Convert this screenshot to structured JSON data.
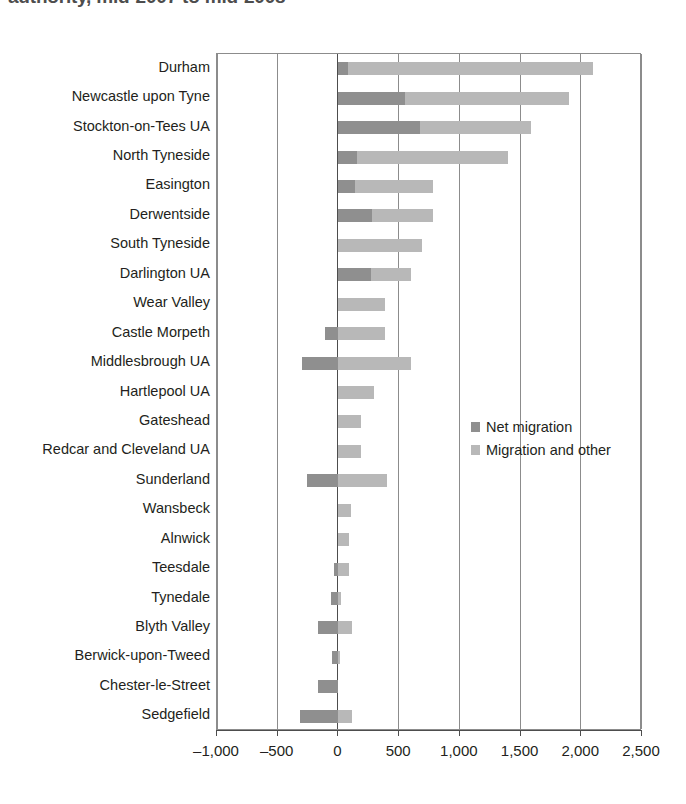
{
  "title": "authority, mid-2007 to mid-2008",
  "legend": {
    "items": [
      {
        "label": "Net migration",
        "color": "#8f8f8f",
        "name": "net-migration"
      },
      {
        "label": "Migration and other",
        "color": "#b8b8b8",
        "name": "migration-and-other"
      }
    ]
  },
  "axis": {
    "tick_labels": [
      "–1,000",
      "–500",
      "0",
      "500",
      "1,000",
      "1,500",
      "2,000",
      "2,500"
    ],
    "tick_values": [
      -1000,
      -500,
      0,
      500,
      1000,
      1500,
      2000,
      2500
    ]
  },
  "chart_data": {
    "type": "bar",
    "orientation": "horizontal",
    "title": "authority, mid-2007 to mid-2008",
    "xlabel": "",
    "ylabel": "",
    "xlim": [
      -1000,
      2500
    ],
    "grid": true,
    "legend_position": "inside-right",
    "categories": [
      "Durham",
      "Newcastle upon Tyne",
      "Stockton-on-Tees UA",
      "North Tyneside",
      "Easington",
      "Derwentside",
      "South Tyneside",
      "Darlington UA",
      "Wear Valley",
      "Castle Morpeth",
      "Middlesbrough UA",
      "Hartlepool UA",
      "Gateshead",
      "Redcar and Cleveland UA",
      "Sunderland",
      "Wansbeck",
      "Alnwick",
      "Teesdale",
      "Tynedale",
      "Blyth Valley",
      "Berwick-upon-Tweed",
      "Chester-le-Street",
      "Sedgefield"
    ],
    "series": [
      {
        "name": "Net migration",
        "color": "#8f8f8f",
        "values": [
          80,
          550,
          670,
          150,
          140,
          280,
          0,
          270,
          0,
          -110,
          -300,
          0,
          0,
          0,
          -260,
          0,
          0,
          -40,
          -60,
          -170,
          -50,
          -170,
          -320
        ]
      },
      {
        "name": "Migration and other",
        "color": "#b8b8b8",
        "values": [
          2100,
          1900,
          1590,
          1400,
          780,
          780,
          690,
          600,
          380,
          380,
          600,
          290,
          190,
          190,
          400,
          100,
          90,
          90,
          20,
          110,
          10,
          0,
          110
        ]
      }
    ],
    "bars": [
      {
        "category": "Durham",
        "net_start": 0,
        "net_end": 80,
        "total_start": 0,
        "total_end": 2100
      },
      {
        "category": "Newcastle upon Tyne",
        "net_start": 0,
        "net_end": 550,
        "total_start": 0,
        "total_end": 1900
      },
      {
        "category": "Stockton-on-Tees UA",
        "net_start": 0,
        "net_end": 670,
        "total_start": 0,
        "total_end": 1590
      },
      {
        "category": "North Tyneside",
        "net_start": 0,
        "net_end": 150,
        "total_start": 0,
        "total_end": 1400
      },
      {
        "category": "Easington",
        "net_start": 0,
        "net_end": 140,
        "total_start": 0,
        "total_end": 780
      },
      {
        "category": "Derwentside",
        "net_start": 0,
        "net_end": 280,
        "total_start": 0,
        "total_end": 780
      },
      {
        "category": "South Tyneside",
        "net_start": 0,
        "net_end": 0,
        "total_start": 0,
        "total_end": 690
      },
      {
        "category": "Darlington UA",
        "net_start": 0,
        "net_end": 270,
        "total_start": 0,
        "total_end": 600
      },
      {
        "category": "Wear Valley",
        "net_start": 0,
        "net_end": 0,
        "total_start": 0,
        "total_end": 380
      },
      {
        "category": "Castle Morpeth",
        "net_start": -110,
        "net_end": 0,
        "total_start": -110,
        "total_end": 380
      },
      {
        "category": "Middlesbrough UA",
        "net_start": -300,
        "net_end": 0,
        "total_start": -300,
        "total_end": 600
      },
      {
        "category": "Hartlepool UA",
        "net_start": 0,
        "net_end": 0,
        "total_start": 0,
        "total_end": 290
      },
      {
        "category": "Gateshead",
        "net_start": 0,
        "net_end": 0,
        "total_start": 0,
        "total_end": 190
      },
      {
        "category": "Redcar and Cleveland UA",
        "net_start": 0,
        "net_end": 0,
        "total_start": 0,
        "total_end": 190
      },
      {
        "category": "Sunderland",
        "net_start": -260,
        "net_end": 0,
        "total_start": -260,
        "total_end": 400
      },
      {
        "category": "Wansbeck",
        "net_start": 0,
        "net_end": 0,
        "total_start": 0,
        "total_end": 100
      },
      {
        "category": "Alnwick",
        "net_start": 0,
        "net_end": 0,
        "total_start": 0,
        "total_end": 90
      },
      {
        "category": "Teesdale",
        "net_start": -40,
        "net_end": 0,
        "total_start": -40,
        "total_end": 90
      },
      {
        "category": "Tynedale",
        "net_start": -60,
        "net_end": 0,
        "total_start": -60,
        "total_end": 20
      },
      {
        "category": "Blyth Valley",
        "net_start": -170,
        "net_end": 0,
        "total_start": -170,
        "total_end": 110
      },
      {
        "category": "Berwick-upon-Tweed",
        "net_start": -50,
        "net_end": 0,
        "total_start": -50,
        "total_end": 10
      },
      {
        "category": "Chester-le-Street",
        "net_start": -170,
        "net_end": 0,
        "total_start": -170,
        "total_end": 0
      },
      {
        "category": "Sedgefield",
        "net_start": -320,
        "net_end": 0,
        "total_start": -320,
        "total_end": 110
      }
    ]
  }
}
